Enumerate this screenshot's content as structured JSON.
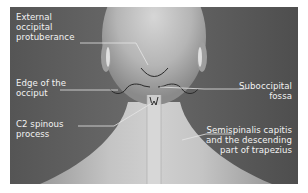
{
  "figure": {
    "colors": {
      "background": "#575757",
      "skin_light": "#c9c9c9",
      "skin_mid": "#a8a8a8",
      "leader_line": "#e6e6e6",
      "outline": "#2a2a2a"
    },
    "labels": [
      {
        "id": "external-occipital-protuberance",
        "lines": [
          "External",
          "occipital",
          "protuberance"
        ]
      },
      {
        "id": "edge-of-the-occiput",
        "lines": [
          "Edge of the",
          "occiput"
        ]
      },
      {
        "id": "c2-spinous-process",
        "lines": [
          "C2 spinous",
          "process"
        ]
      },
      {
        "id": "suboccipital-fossa",
        "lines": [
          "Suboccipital",
          "fossa"
        ]
      },
      {
        "id": "semispinalis-trapezius",
        "lines": [
          "Semispinalis capitis",
          "and the descending",
          "part of trapezius"
        ]
      }
    ]
  }
}
